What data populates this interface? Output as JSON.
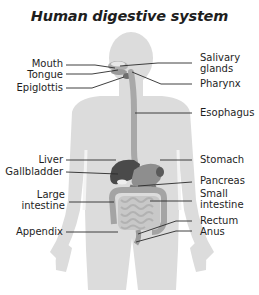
{
  "title": "Human digestive system",
  "colors": {
    "silhouette": "#dcdcdc",
    "organ": "#9e9e9e",
    "organ_dark": "#4a4a4a",
    "leader_line": "#2a2a2a",
    "text": "#1e1e1e"
  },
  "labels_left": [
    {
      "id": "mouth",
      "text": "Mouth"
    },
    {
      "id": "tongue",
      "text": "Tongue"
    },
    {
      "id": "epiglottis",
      "text": "Epiglottis"
    },
    {
      "id": "liver",
      "text": "Liver"
    },
    {
      "id": "gallbladder",
      "text": "Gallbladder"
    },
    {
      "id": "large-intestine",
      "line1": "Large",
      "line2": "intestine"
    },
    {
      "id": "appendix",
      "text": "Appendix"
    }
  ],
  "labels_right": [
    {
      "id": "salivary-glands",
      "line1": "Salivary",
      "line2": "glands"
    },
    {
      "id": "pharynx",
      "text": "Pharynx"
    },
    {
      "id": "esophagus",
      "text": "Esophagus"
    },
    {
      "id": "stomach",
      "text": "Stomach"
    },
    {
      "id": "pancreas",
      "text": "Pancreas"
    },
    {
      "id": "small-intestine",
      "line1": "Small",
      "line2": "intestine"
    },
    {
      "id": "rectum",
      "text": "Rectum"
    },
    {
      "id": "anus",
      "text": "Anus"
    }
  ]
}
